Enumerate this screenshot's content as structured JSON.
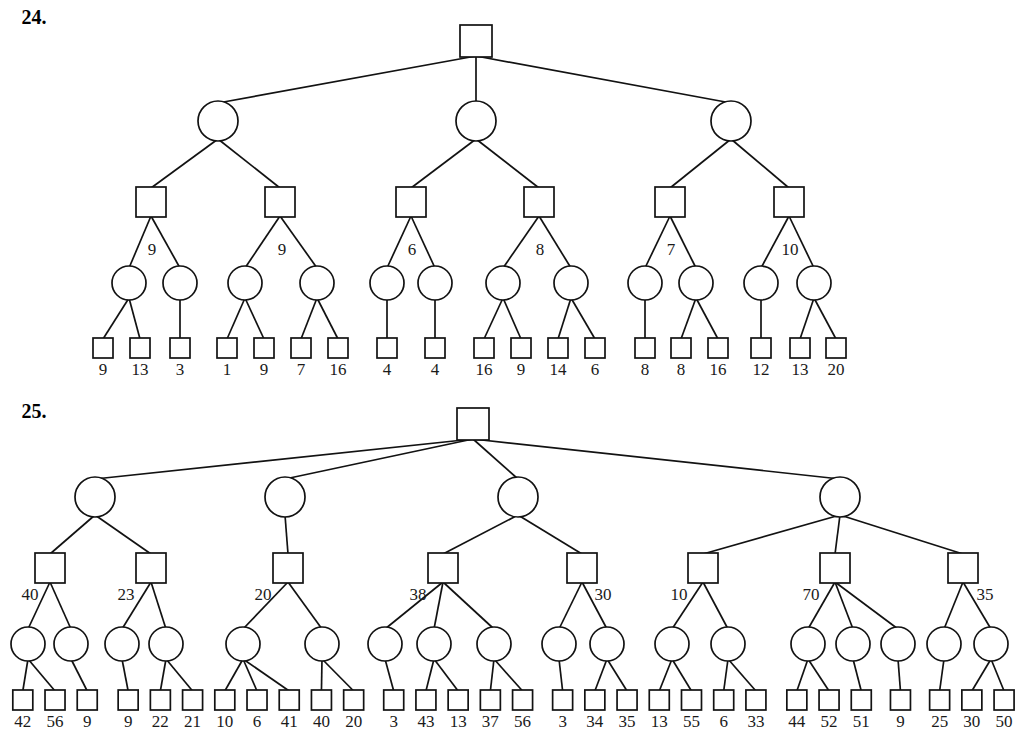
{
  "page": {
    "background_color": "#ffffff",
    "ink_color": "#121212",
    "width": 1025,
    "height": 749
  },
  "problems": [
    {
      "id": "problem-24",
      "number_label": "24.",
      "number_x": 34,
      "number_y": 24,
      "root": {
        "shape": "square",
        "x": 476,
        "y": 41
      },
      "level2": [
        {
          "shape": "circle",
          "x": 218,
          "y": 121
        },
        {
          "shape": "circle",
          "x": 476,
          "y": 121
        },
        {
          "shape": "circle",
          "x": 731,
          "y": 121
        }
      ],
      "level3": [
        {
          "shape": "square",
          "x": 151,
          "y": 202,
          "edge_label": "9",
          "label_x": 152,
          "label_y": 255
        },
        {
          "shape": "square",
          "x": 280,
          "y": 202,
          "edge_label": "9",
          "label_x": 282,
          "label_y": 255
        },
        {
          "shape": "square",
          "x": 411,
          "y": 202,
          "edge_label": "6",
          "label_x": 412,
          "label_y": 255
        },
        {
          "shape": "square",
          "x": 539,
          "y": 202,
          "edge_label": "8",
          "label_x": 540,
          "label_y": 255
        },
        {
          "shape": "square",
          "x": 670,
          "y": 202,
          "edge_label": "7",
          "label_x": 671,
          "label_y": 255
        },
        {
          "shape": "square",
          "x": 789,
          "y": 202,
          "edge_label": "10",
          "label_x": 790,
          "label_y": 255
        }
      ],
      "level4": [
        {
          "shape": "circle",
          "x": 129,
          "y": 283,
          "parent": 0
        },
        {
          "shape": "circle",
          "x": 180,
          "y": 283,
          "parent": 0
        },
        {
          "shape": "circle",
          "x": 245,
          "y": 283,
          "parent": 1
        },
        {
          "shape": "circle",
          "x": 317,
          "y": 283,
          "parent": 1
        },
        {
          "shape": "circle",
          "x": 387,
          "y": 283,
          "parent": 2
        },
        {
          "shape": "circle",
          "x": 435,
          "y": 283,
          "parent": 2
        },
        {
          "shape": "circle",
          "x": 503,
          "y": 283,
          "parent": 3
        },
        {
          "shape": "circle",
          "x": 571,
          "y": 283,
          "parent": 3
        },
        {
          "shape": "circle",
          "x": 645,
          "y": 283,
          "parent": 4
        },
        {
          "shape": "circle",
          "x": 696,
          "y": 283,
          "parent": 4
        },
        {
          "shape": "circle",
          "x": 761,
          "y": 283,
          "parent": 5
        },
        {
          "shape": "circle",
          "x": 814,
          "y": 283,
          "parent": 5
        }
      ],
      "leaves": [
        {
          "value": "9",
          "x": 103,
          "y": 348,
          "parent": 0
        },
        {
          "value": "13",
          "x": 140,
          "y": 348,
          "parent": 0
        },
        {
          "value": "3",
          "x": 180,
          "y": 348,
          "parent": 1
        },
        {
          "value": "1",
          "x": 227,
          "y": 348,
          "parent": 2
        },
        {
          "value": "9",
          "x": 264,
          "y": 348,
          "parent": 2
        },
        {
          "value": "7",
          "x": 301,
          "y": 348,
          "parent": 3
        },
        {
          "value": "16",
          "x": 338,
          "y": 348,
          "parent": 3
        },
        {
          "value": "4",
          "x": 387,
          "y": 348,
          "parent": 4
        },
        {
          "value": "4",
          "x": 435,
          "y": 348,
          "parent": 5
        },
        {
          "value": "16",
          "x": 484,
          "y": 348,
          "parent": 6
        },
        {
          "value": "9",
          "x": 521,
          "y": 348,
          "parent": 6
        },
        {
          "value": "14",
          "x": 558,
          "y": 348,
          "parent": 7
        },
        {
          "value": "6",
          "x": 595,
          "y": 348,
          "parent": 7
        },
        {
          "value": "8",
          "x": 645,
          "y": 348,
          "parent": 8
        },
        {
          "value": "8",
          "x": 681,
          "y": 348,
          "parent": 9
        },
        {
          "value": "16",
          "x": 718,
          "y": 348,
          "parent": 9
        },
        {
          "value": "12",
          "x": 761,
          "y": 348,
          "parent": 10
        },
        {
          "value": "13",
          "x": 800,
          "y": 348,
          "parent": 11
        },
        {
          "value": "20",
          "x": 836,
          "y": 348,
          "parent": 11
        }
      ],
      "leaf_label_y": 375
    },
    {
      "id": "problem-25",
      "number_label": "25.",
      "number_x": 34,
      "number_y": 418,
      "root": {
        "shape": "square",
        "x": 473,
        "y": 424
      },
      "level2": [
        {
          "shape": "circle",
          "x": 95,
          "y": 497
        },
        {
          "shape": "circle",
          "x": 285,
          "y": 497
        },
        {
          "shape": "circle",
          "x": 518,
          "y": 497
        },
        {
          "shape": "circle",
          "x": 840,
          "y": 497
        }
      ],
      "level3": [
        {
          "shape": "square",
          "x": 50,
          "y": 568,
          "parent": 0,
          "edge_label": "40",
          "label_x": 30,
          "label_y": 600
        },
        {
          "shape": "square",
          "x": 151,
          "y": 568,
          "parent": 0,
          "edge_label": "23",
          "label_x": 126,
          "label_y": 600
        },
        {
          "shape": "square",
          "x": 288,
          "y": 568,
          "parent": 1,
          "edge_label": "20",
          "label_x": 263,
          "label_y": 600
        },
        {
          "shape": "square",
          "x": 443,
          "y": 568,
          "parent": 2,
          "edge_label": "38",
          "label_x": 418,
          "label_y": 600
        },
        {
          "shape": "square",
          "x": 582,
          "y": 568,
          "parent": 2,
          "edge_label": "30",
          "label_x": 603,
          "label_y": 600
        },
        {
          "shape": "square",
          "x": 703,
          "y": 568,
          "parent": 3,
          "edge_label": "10",
          "label_x": 679,
          "label_y": 600
        },
        {
          "shape": "square",
          "x": 835,
          "y": 568,
          "parent": 3,
          "edge_label": "70",
          "label_x": 811,
          "label_y": 600
        },
        {
          "shape": "square",
          "x": 963,
          "y": 568,
          "parent": 3,
          "edge_label": "35",
          "label_x": 985,
          "label_y": 600
        }
      ],
      "level4": [
        {
          "shape": "circle",
          "x": 28,
          "y": 644,
          "parent": 0
        },
        {
          "shape": "circle",
          "x": 71,
          "y": 644,
          "parent": 0
        },
        {
          "shape": "circle",
          "x": 122,
          "y": 644,
          "parent": 1
        },
        {
          "shape": "circle",
          "x": 166,
          "y": 644,
          "parent": 1
        },
        {
          "shape": "circle",
          "x": 243,
          "y": 644,
          "parent": 2
        },
        {
          "shape": "circle",
          "x": 322,
          "y": 644,
          "parent": 2
        },
        {
          "shape": "circle",
          "x": 385,
          "y": 644,
          "parent": 3
        },
        {
          "shape": "circle",
          "x": 434,
          "y": 644,
          "parent": 3
        },
        {
          "shape": "circle",
          "x": 494,
          "y": 644,
          "parent": 3
        },
        {
          "shape": "circle",
          "x": 559,
          "y": 644,
          "parent": 4
        },
        {
          "shape": "circle",
          "x": 607,
          "y": 644,
          "parent": 4
        },
        {
          "shape": "circle",
          "x": 672,
          "y": 644,
          "parent": 5
        },
        {
          "shape": "circle",
          "x": 728,
          "y": 644,
          "parent": 5
        },
        {
          "shape": "circle",
          "x": 808,
          "y": 644,
          "parent": 6
        },
        {
          "shape": "circle",
          "x": 853,
          "y": 644,
          "parent": 6
        },
        {
          "shape": "circle",
          "x": 898,
          "y": 644,
          "parent": 6
        },
        {
          "shape": "circle",
          "x": 944,
          "y": 644,
          "parent": 7
        },
        {
          "shape": "circle",
          "x": 991,
          "y": 644,
          "parent": 7
        }
      ],
      "leaves": [
        {
          "value": "42",
          "x": 17,
          "y": 700,
          "parent": 0
        },
        {
          "value": "56",
          "x": 54,
          "y": 700,
          "parent": 0
        },
        {
          "value": "9",
          "x": 91,
          "y": 700,
          "parent": 1
        },
        {
          "value": "9",
          "x": 138,
          "y": 700,
          "parent": 2
        },
        {
          "value": "22",
          "x": 175,
          "y": 700,
          "parent": 3
        },
        {
          "value": "21",
          "x": 212,
          "y": 700,
          "parent": 3
        },
        {
          "value": "10",
          "x": 249,
          "y": 700,
          "parent": 4
        },
        {
          "value": "6",
          "x": 286,
          "y": 700,
          "parent": 4
        },
        {
          "value": "41",
          "x": 323,
          "y": 700,
          "parent": 4
        },
        {
          "value": "40",
          "x": 360,
          "y": 700,
          "parent": 5
        },
        {
          "value": "20",
          "x": 397,
          "y": 700,
          "parent": 5
        },
        {
          "value": "3",
          "x": 443,
          "y": 700,
          "parent": 6
        },
        {
          "value": "43",
          "x": 480,
          "y": 700,
          "parent": 7
        },
        {
          "value": "13",
          "x": 517,
          "y": 700,
          "parent": 7
        },
        {
          "value": "37",
          "x": 554,
          "y": 700,
          "parent": 8
        },
        {
          "value": "56",
          "x": 591,
          "y": 700,
          "parent": 8
        },
        {
          "value": "3",
          "x": 637,
          "y": 700,
          "parent": 9
        },
        {
          "value": "34",
          "x": 674,
          "y": 700,
          "parent": 10
        },
        {
          "value": "35",
          "x": 711,
          "y": 700,
          "parent": 10
        },
        {
          "value": "13",
          "x": 748,
          "y": 700,
          "parent": 11
        },
        {
          "value": "55",
          "x": 785,
          "y": 700,
          "parent": 11
        },
        {
          "value": "6",
          "x": 822,
          "y": 700,
          "parent": 12
        },
        {
          "value": "33",
          "x": 859,
          "y": 700,
          "parent": 12
        },
        {
          "value": "44",
          "x": 906,
          "y": 700,
          "parent": 13
        },
        {
          "value": "52",
          "x": 943,
          "y": 700,
          "parent": 13
        },
        {
          "value": "51",
          "x": 980,
          "y": 700,
          "parent": 14
        },
        {
          "value": "9",
          "x": 1025,
          "y": 700,
          "parent": 15
        },
        {
          "value": "25",
          "x": 1070,
          "y": 700,
          "parent": 16
        },
        {
          "value": "30",
          "x": 1107,
          "y": 700,
          "parent": 17
        },
        {
          "value": "50",
          "x": 1144,
          "y": 700,
          "parent": 17
        }
      ],
      "leaf_label_y": 727
    }
  ]
}
